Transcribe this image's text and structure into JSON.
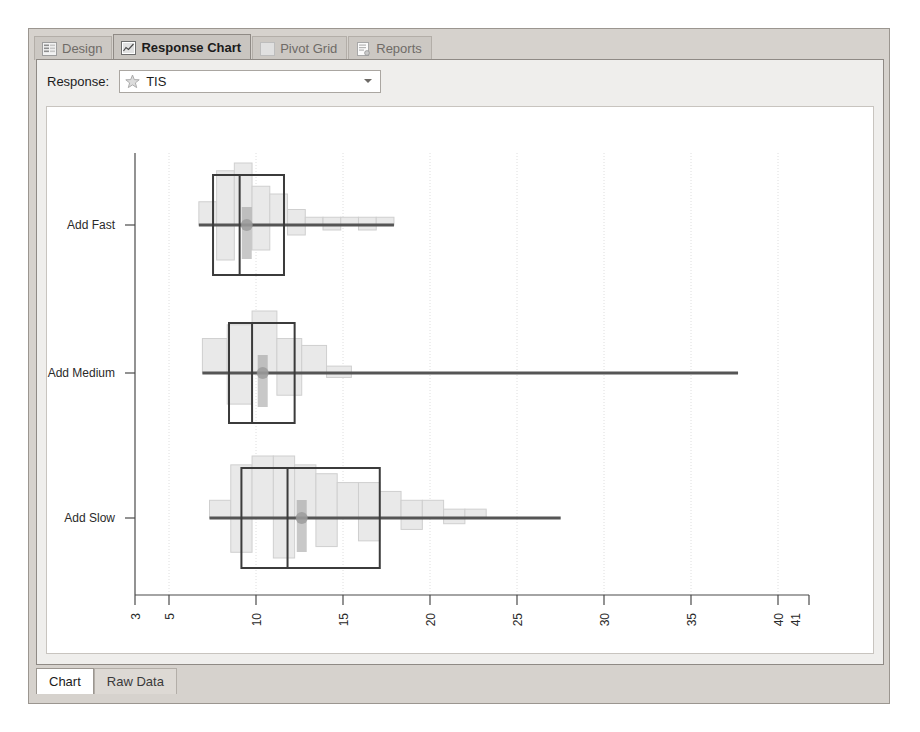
{
  "window": {
    "top_tabs": [
      {
        "label": "Design",
        "icon": "list-lines-icon",
        "active": false
      },
      {
        "label": "Response Chart",
        "icon": "chart-icon",
        "active": true
      },
      {
        "label": "Pivot Grid",
        "icon": "grid-icon",
        "active": false
      },
      {
        "label": "Reports",
        "icon": "report-icon",
        "active": false
      }
    ],
    "bottom_tabs": [
      {
        "label": "Chart",
        "active": true
      },
      {
        "label": "Raw Data",
        "active": false
      }
    ]
  },
  "toolbar": {
    "response_label": "Response:",
    "response_value": "TIS",
    "response_icon": "star-icon",
    "dropdown_arrow_icon": "chevron-down-icon"
  },
  "colors": {
    "frame": "#d6d2cd",
    "panel": "#efeeec",
    "plot_bg": "#ffffff",
    "axis": "#4a4a4a",
    "grid": "#dcdcdc",
    "hist_fill": "#e9e9e9",
    "hist_stroke": "#cfcfcf",
    "box_stroke": "#3b3b3b",
    "whisker": "#555555",
    "median_marker": "#9a9a9a"
  },
  "chart_data": {
    "type": "boxplot",
    "title": "",
    "xlabel": "",
    "ylabel": "",
    "orientation": "horizontal",
    "grid": true,
    "legend": "none",
    "xlim": [
      3,
      41
    ],
    "xticks": [
      3,
      5,
      10,
      15,
      20,
      25,
      30,
      35,
      40,
      41
    ],
    "xticklabels": [
      "3",
      "5",
      "10",
      "15",
      "20",
      "25",
      "30",
      "35",
      "40",
      "41"
    ],
    "categories": [
      "Add Fast",
      "Add Medium",
      "Add Slow"
    ],
    "series": [
      {
        "name": "Add Fast",
        "whisker_low": 6.6,
        "q1": 7.4,
        "median": 8.9,
        "q3": 11.4,
        "whisker_high": 17.6,
        "mean": 9.3,
        "histogram": {
          "bin_width": 1.0,
          "bins": [
            6.6,
            7.6,
            8.6,
            9.6,
            10.6,
            11.6,
            12.6,
            13.6,
            14.6,
            15.6,
            16.6
          ],
          "counts": [
            3,
            7,
            8,
            5,
            4,
            2,
            1,
            1,
            1,
            1,
            1
          ]
        }
      },
      {
        "name": "Add Medium",
        "whisker_low": 6.8,
        "q1": 8.3,
        "median": 9.6,
        "q3": 12.0,
        "whisker_high": 37.0,
        "mean": 10.2,
        "histogram": {
          "bin_width": 1.4,
          "bins": [
            6.8,
            8.2,
            9.6,
            11.0,
            12.4,
            13.8
          ],
          "counts": [
            5,
            7,
            9,
            5,
            4,
            1
          ]
        }
      },
      {
        "name": "Add Slow",
        "whisker_low": 7.2,
        "q1": 9.0,
        "median": 11.6,
        "q3": 16.8,
        "whisker_high": 27.0,
        "mean": 12.4,
        "histogram": {
          "bin_width": 1.2,
          "bins": [
            7.2,
            8.4,
            9.6,
            10.8,
            12.0,
            13.2,
            14.4,
            15.6,
            16.8,
            18.0,
            19.2,
            20.4,
            21.6
          ],
          "counts": [
            2,
            6,
            7,
            7,
            6,
            5,
            4,
            4,
            3,
            2,
            2,
            1,
            1
          ]
        }
      }
    ]
  }
}
